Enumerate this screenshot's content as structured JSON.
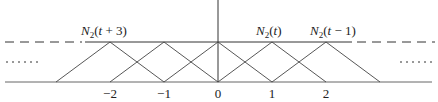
{
  "diagram": {
    "axis": {
      "x_origin_px": 218,
      "unit_px": 54,
      "baseline_y": 82,
      "top_y": 42
    },
    "ticks": [
      {
        "value": -2,
        "label": "−2"
      },
      {
        "value": -1,
        "label": "−1"
      },
      {
        "value": 0,
        "label": "0"
      },
      {
        "value": 1,
        "label": "1"
      },
      {
        "value": 2,
        "label": "2"
      }
    ],
    "functions": [
      {
        "label": "N₂(t + 3)",
        "sub_main": "N",
        "sub": "2",
        "arg": "(t + 3)",
        "peak": -2,
        "labeled": true
      },
      {
        "label": "",
        "peak": -1,
        "labeled": false
      },
      {
        "label": "",
        "peak": 0,
        "labeled": false
      },
      {
        "label": "N₂(t)",
        "sub_main": "N",
        "sub": "2",
        "arg": "(t)",
        "peak": 1,
        "labeled": true
      },
      {
        "label": "N₂(t − 1)",
        "sub_main": "N",
        "sub": "2",
        "arg": "(t − 1)",
        "peak": 2,
        "labeled": true
      }
    ],
    "continuation_left": "- - - -",
    "continuation_right": "- - - -",
    "ellipsis_left": ".....",
    "ellipsis_right": "....."
  }
}
